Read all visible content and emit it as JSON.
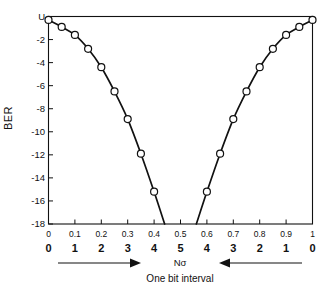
{
  "chart_data": {
    "type": "line",
    "title": "",
    "xlabel": "Nσ",
    "ylabel": "BER",
    "caption": "One bit interval",
    "grid": false,
    "legend": false,
    "xlim": [
      0,
      1
    ],
    "ylim": [
      -18,
      0
    ],
    "y_axis": {
      "label": "BER",
      "top_label": "U",
      "ticks": [
        0,
        -2,
        -4,
        -6,
        -8,
        -10,
        -12,
        -14,
        -16,
        -18
      ],
      "tick_labels": [
        "U",
        "-2",
        "-4",
        "-6",
        "-8",
        "-10",
        "-12",
        "-14",
        "-16",
        "-18"
      ],
      "note": "log10 of bit error rate; U denotes top of scale"
    },
    "x_axis": {
      "primary_ticks": [
        0,
        0.1,
        0.2,
        0.3,
        0.4,
        0.5,
        0.6,
        0.7,
        0.8,
        0.9,
        1
      ],
      "primary_tick_labels": [
        "0",
        "0.1",
        "0.2",
        "0.3",
        "0.4",
        "0.5",
        "0.6",
        "0.7",
        "0.8",
        "0.9",
        "1"
      ],
      "secondary_tick_labels": [
        "0",
        "1",
        "2",
        "3",
        "4",
        "5",
        "4",
        "3",
        "2",
        "1",
        "0"
      ],
      "secondary_note": "Nσ sampling-phase offset, mirrored about mid bit"
    },
    "annotations": [
      {
        "name": "left-arrow",
        "direction": "right"
      },
      {
        "name": "axis-symbol",
        "text": "Nσ"
      },
      {
        "name": "right-arrow",
        "direction": "left"
      },
      {
        "name": "caption",
        "text": "One bit interval"
      }
    ],
    "series": [
      {
        "name": "BER vs sampling phase (left branch)",
        "marker": "open-circle",
        "x": [
          0.0,
          0.05,
          0.1,
          0.15,
          0.2,
          0.25,
          0.3,
          0.35,
          0.4
        ],
        "y": [
          -0.3,
          -0.9,
          -1.6,
          -2.8,
          -4.4,
          -6.5,
          -8.9,
          -11.9,
          -15.2
        ]
      },
      {
        "name": "BER vs sampling phase (right branch)",
        "marker": "open-circle",
        "x": [
          0.6,
          0.65,
          0.7,
          0.75,
          0.8,
          0.85,
          0.9,
          0.95,
          1.0
        ],
        "y": [
          -15.2,
          -11.9,
          -8.9,
          -6.5,
          -4.4,
          -2.8,
          -1.6,
          -0.9,
          -0.3
        ]
      }
    ],
    "curve_left_endpoint_x": 0.44,
    "curve_right_endpoint_x": 0.56,
    "colors": {
      "line": "#111111",
      "marker_fill": "#ffffff",
      "axis": "#111111",
      "background": "#ffffff"
    }
  }
}
